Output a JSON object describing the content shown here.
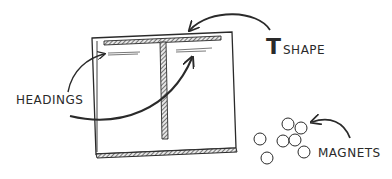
{
  "diagram": {
    "labels": {
      "headings": "HEADINGS",
      "t_letter": "T",
      "t_rest": "SHAPE",
      "magnets": "MAGNETS"
    },
    "elements": [
      {
        "id": "board",
        "kind": "whiteboard"
      },
      {
        "id": "t-bar",
        "kind": "tape-strip",
        "description": "T shape divider"
      },
      {
        "id": "headings",
        "kind": "heading-lines",
        "count": 2
      },
      {
        "id": "magnets",
        "kind": "magnet-cluster",
        "count": 7
      }
    ],
    "colors": {
      "ink": "#2a2a2a",
      "hatch": "#555555",
      "paper": "#ffffff"
    }
  }
}
